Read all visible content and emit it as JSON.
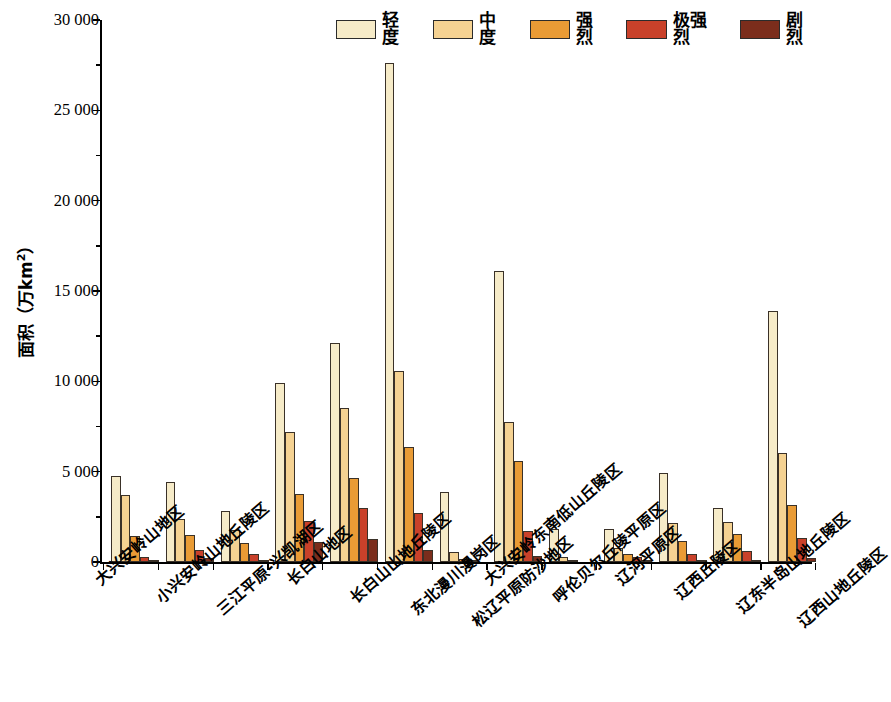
{
  "chart_data": {
    "type": "bar",
    "title": "",
    "xlabel": "",
    "ylabel": "面积（万km²）",
    "ylim": [
      0,
      30000
    ],
    "ytick_labels": [
      "0",
      "5 000",
      "10 000",
      "15 000",
      "20 000",
      "25 000",
      "30 000"
    ],
    "ytick_values": [
      0,
      5000,
      10000,
      15000,
      20000,
      25000,
      30000
    ],
    "minor_tick_interval": 2500,
    "grid": false,
    "legend_position": "top-right",
    "categories": [
      "大兴安岭山地区",
      "小兴安岭山地丘陵区",
      "三江平原-兴凯湖区",
      "长白山地区",
      "长白山山地丘陵区",
      "东北漫川漫岗区",
      "松辽平原防沙地区",
      "大兴安岭东南低山丘陵区",
      "呼伦贝尔丘陵平原区",
      "辽河平原区",
      "辽西丘陵区",
      "辽东半岛山地丘陵区",
      "辽西山地丘陵区"
    ],
    "series": [
      {
        "name": "轻度",
        "color": "#f6ebc8",
        "values": [
          4750,
          4450,
          2850,
          9900,
          12100,
          27600,
          3900,
          16100,
          1800,
          1850,
          4900,
          3000,
          13900
        ]
      },
      {
        "name": "中度",
        "color": "#f5d292",
        "values": [
          3700,
          2400,
          1750,
          7200,
          8500,
          10600,
          550,
          7750,
          300,
          800,
          2150,
          2200,
          6050
        ]
      },
      {
        "name": "强烈",
        "color": "#e99b35",
        "values": [
          1450,
          1500,
          1050,
          3750,
          4650,
          6350,
          150,
          5600,
          100,
          450,
          1150,
          1550,
          3150
        ]
      },
      {
        "name": "极强烈",
        "color": "#c9412a",
        "values": [
          250,
          650,
          450,
          2250,
          3000,
          2700,
          50,
          1700,
          0,
          250,
          450,
          600,
          1350
        ]
      },
      {
        "name": "剧烈",
        "color": "#7b2d1c",
        "values": [
          100,
          200,
          100,
          1100,
          1300,
          650,
          0,
          350,
          0,
          100,
          50,
          50,
          200
        ]
      }
    ]
  }
}
